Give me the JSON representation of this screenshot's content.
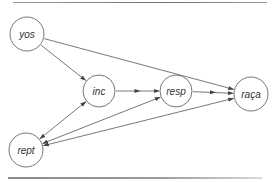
{
  "diagram": {
    "type": "directed-graph",
    "colors": {
      "line": "#555555",
      "node_stroke": "#666666",
      "node_fill": "#ffffff",
      "text": "#333333"
    },
    "nodes": [
      {
        "id": "yos",
        "label": "yos",
        "cx": 27,
        "cy": 34,
        "r": 17
      },
      {
        "id": "inc",
        "label": "inc",
        "cx": 99,
        "cy": 91,
        "r": 16
      },
      {
        "id": "resp",
        "label": "resp",
        "cx": 176,
        "cy": 91,
        "r": 16
      },
      {
        "id": "raca",
        "label": "raça",
        "cx": 251,
        "cy": 94,
        "r": 17
      },
      {
        "id": "rept",
        "label": "rept",
        "cx": 26,
        "cy": 150,
        "r": 17
      }
    ],
    "edges": [
      {
        "from": "yos",
        "to": "inc",
        "direction": "forward"
      },
      {
        "from": "yos",
        "to": "raca",
        "direction": "forward"
      },
      {
        "from": "inc",
        "to": "resp",
        "direction": "forward",
        "mid_arrow": true
      },
      {
        "from": "resp",
        "to": "raca",
        "direction": "forward",
        "mid_arrow": true
      },
      {
        "from": "inc",
        "to": "rept",
        "direction": "both"
      },
      {
        "from": "resp",
        "to": "rept",
        "direction": "both"
      },
      {
        "from": "raca",
        "to": "rept",
        "direction": "both"
      }
    ]
  }
}
